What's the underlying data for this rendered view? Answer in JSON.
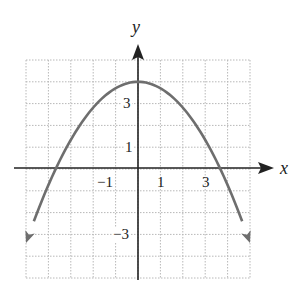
{
  "chart_data": {
    "type": "line",
    "title": "",
    "xlabel": "x",
    "ylabel": "y",
    "xlim": [
      -5,
      5
    ],
    "ylim": [
      -5,
      5
    ],
    "grid": true,
    "x_tick_labels": [
      "-1",
      "1",
      "3"
    ],
    "y_tick_labels": [
      "3",
      "1",
      "-3"
    ],
    "series": [
      {
        "name": "parabola",
        "equation": "y = -0.3x^2 + 4",
        "vertex": [
          0,
          4
        ],
        "x_intercepts": [
          -3.65,
          3.65
        ],
        "endpoints_with_arrows": [
          [
            -5,
            -3.4
          ],
          [
            5,
            -3.4
          ]
        ],
        "x": [
          -5,
          -4,
          -3,
          -2,
          -1,
          0,
          1,
          2,
          3,
          4,
          5
        ],
        "values": [
          -3.5,
          -0.8,
          1.3,
          2.8,
          3.7,
          4,
          3.7,
          2.8,
          1.3,
          -0.8,
          -3.5
        ]
      }
    ],
    "colors": {
      "curve": "#6e6e6e",
      "axes": "#222222",
      "grid": "#bbbbbb"
    }
  },
  "labels": {
    "x_axis": "x",
    "y_axis": "y",
    "xt_m1": "−1",
    "xt_1": "1",
    "xt_3": "3",
    "yt_3": "3",
    "yt_1": "1",
    "yt_m3": "−3"
  }
}
